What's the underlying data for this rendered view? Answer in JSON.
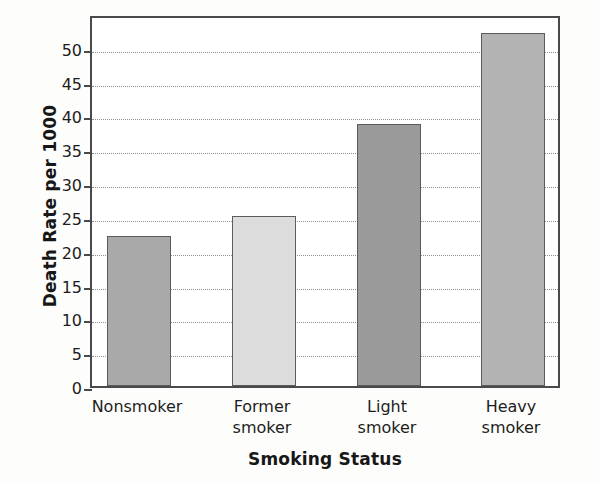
{
  "chart_data": {
    "type": "bar",
    "title": "",
    "xlabel": "Smoking Status",
    "ylabel": "Death Rate per 1000",
    "categories": [
      "Nonsmoker",
      "Former smoker",
      "Light smoker",
      "Heavy smoker"
    ],
    "category_lines": [
      [
        "Nonsmoker"
      ],
      [
        "Former",
        "smoker"
      ],
      [
        "Light",
        "smoker"
      ],
      [
        "Heavy",
        "smoker"
      ]
    ],
    "values": [
      22.2,
      25.1,
      38.7,
      52.2
    ],
    "bar_colors": [
      "#a9a9a9",
      "#dcdcdc",
      "#9a9a9a",
      "#b3b3b3"
    ],
    "ylim": [
      0,
      55
    ],
    "yticks": [
      0,
      5,
      10,
      15,
      20,
      25,
      30,
      35,
      40,
      45,
      50
    ],
    "ytick_labels": [
      "0",
      "5",
      "10",
      "15",
      "20",
      "25",
      "30",
      "35",
      "40",
      "45",
      "50"
    ],
    "grid": true,
    "grid_style": "dotted",
    "legend": "none",
    "axis_color": "#4a4a4a"
  }
}
